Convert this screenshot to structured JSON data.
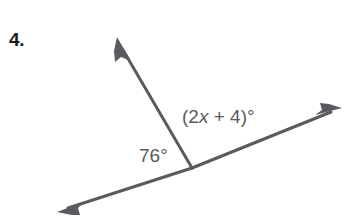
{
  "problem": {
    "number_label": "4."
  },
  "figure": {
    "type": "angle-diagram",
    "line_color": "#5a5a5f",
    "label_color": "#5a5a5f",
    "background_color": "#ffffff",
    "vertex": {
      "x": 192,
      "y": 168
    },
    "rays": [
      {
        "name": "upper-left-ray",
        "from": {
          "x": 192,
          "y": 168
        },
        "to": {
          "x": 117,
          "y": 37
        },
        "arrowhead": "end"
      },
      {
        "name": "lower-left-ray",
        "from": {
          "x": 192,
          "y": 168
        },
        "to": {
          "x": 57,
          "y": 212
        },
        "arrowhead": "end"
      },
      {
        "name": "right-ray",
        "from": {
          "x": 192,
          "y": 168
        },
        "to": {
          "x": 342,
          "y": 108
        },
        "arrowhead": "end"
      }
    ],
    "labels": {
      "left_angle": "76°",
      "right_angle_prefix": "(2",
      "right_angle_var": "x",
      "right_angle_suffix": " + 4)°"
    }
  }
}
